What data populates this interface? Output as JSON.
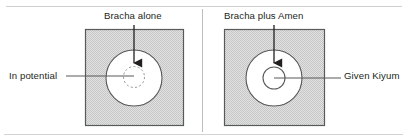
{
  "figure": {
    "background_color": "#ffffff",
    "width": 407,
    "height": 138
  },
  "colors": {
    "ink": "#231f20",
    "square_stroke": "#58595b",
    "square_fill": "#d9d9d9",
    "circle_stroke": "#58595b",
    "circle_fill": "#ffffff",
    "dashed_stroke": "#9a9a9a",
    "leader_line": "#58595b",
    "arrow": "#231f20",
    "divider": "#bdbdbd",
    "rule": "#cfcfcf"
  },
  "panels": [
    {
      "id": "left",
      "title": "Bracha alone",
      "side_label": "In potential",
      "side_label_position": "left",
      "inner_circle_style": "dashed",
      "arrow_label": "Bracha alone"
    },
    {
      "id": "right",
      "title": "Bracha plus Amen",
      "side_label": "Given Kiyum",
      "side_label_position": "right",
      "inner_circle_style": "solid",
      "arrow_label": "Bracha plus Amen"
    }
  ],
  "geometry": {
    "left_square": {
      "x": 85,
      "y": 29,
      "w": 99,
      "h": 97
    },
    "right_square": {
      "x": 224,
      "y": 29,
      "w": 101,
      "h": 97
    },
    "left_outer_circle": {
      "cx": 134,
      "cy": 78,
      "r": 28
    },
    "left_inner_circle": {
      "cx": 134,
      "cy": 77,
      "r": 10.5
    },
    "right_outer_circle": {
      "cx": 274,
      "cy": 78,
      "r": 28
    },
    "right_inner_circle": {
      "cx": 274,
      "cy": 78,
      "r": 11
    },
    "left_arrow": {
      "x": 134,
      "y1": 25,
      "y2": 71
    },
    "right_arrow": {
      "x": 274,
      "y1": 25,
      "y2": 71
    },
    "left_leader": {
      "x1": 66,
      "x2": 134,
      "y": 76
    },
    "right_leader": {
      "x1": 274,
      "x2": 341,
      "y": 78
    }
  }
}
